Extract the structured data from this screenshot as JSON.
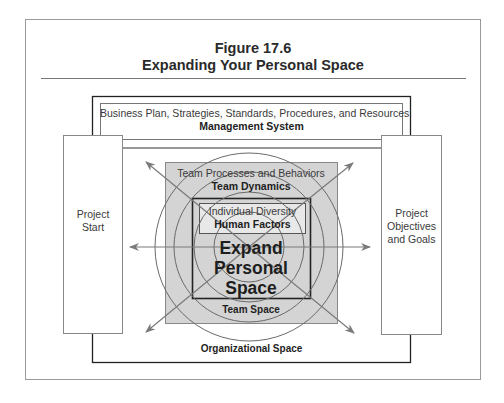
{
  "figure": {
    "number": "Figure 17.6",
    "title": "Expanding Your Personal Space"
  },
  "diagram": {
    "management_system": {
      "subtitle": "Business Plan, Strategies, Standards, Procedures, and Resources",
      "label": "Management System"
    },
    "project_start": {
      "line1": "Project",
      "line2": "Start"
    },
    "project_objectives": {
      "line1": "Project",
      "line2": "Objectives",
      "line3": "and Goals"
    },
    "team_dynamics": {
      "subtitle": "Team Processes and Behaviors",
      "label": "Team Dynamics"
    },
    "human_factors": {
      "subtitle": "Individual Diversity",
      "label": "Human Factors"
    },
    "center": {
      "line1": "Expand",
      "line2": "Personal",
      "line3": "Space"
    },
    "team_space": "Team Space",
    "organizational_space": "Organizational Space",
    "colors": {
      "team_box_fill": "#d4d4d4",
      "human_factors_fill": "#e8e8e8",
      "line": "#333333",
      "arrow": "#7a7a7a"
    }
  }
}
